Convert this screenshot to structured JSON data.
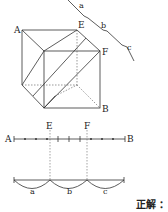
{
  "cube": {
    "labels": {
      "A": "A",
      "E": "E",
      "F": "F",
      "B": "B"
    },
    "segment_labels": {
      "a": "a",
      "b": "b",
      "c": "c"
    }
  },
  "number_line": {
    "left": "A",
    "right": "B",
    "markers": {
      "E": "E",
      "F": "F"
    },
    "arcs": {
      "a": "a",
      "b": "b",
      "c": "c"
    }
  },
  "answer": {
    "label": "正解 ："
  }
}
